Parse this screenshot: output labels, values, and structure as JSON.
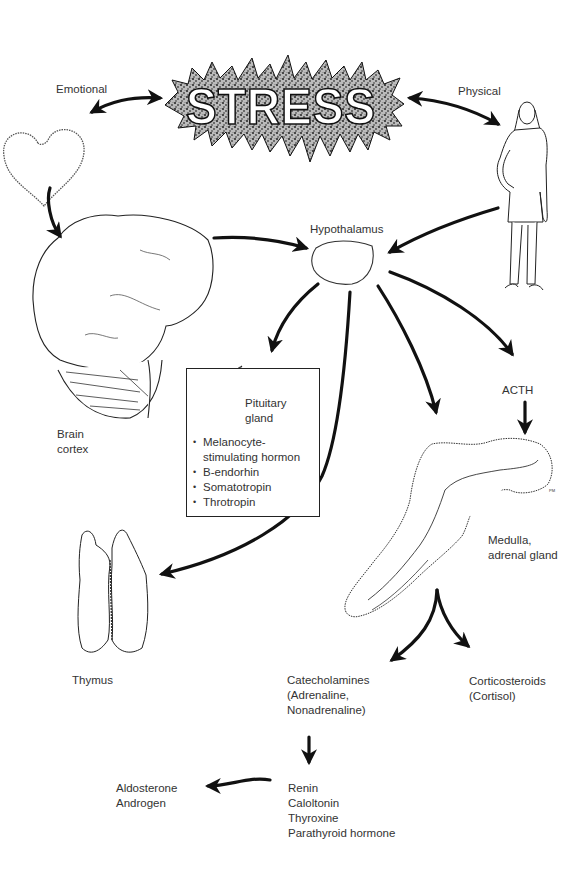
{
  "diagram": {
    "title": "STRESS",
    "colors": {
      "ink": "#111111",
      "text": "#333333",
      "background": "#ffffff"
    },
    "inputs": [
      {
        "id": "emotional",
        "label": "Emotional",
        "icon": "heart-icon"
      },
      {
        "id": "physical",
        "label": "Physical",
        "icon": "woman-figure-icon"
      }
    ],
    "nodes": {
      "brain": {
        "label_lines": [
          "Brain",
          "cortex"
        ],
        "icon": "brain-icon"
      },
      "hypothalamus": {
        "label": "Hypothalamus",
        "icon": "hypothalamus-icon"
      },
      "pituitary": {
        "title_lines": [
          "Pituitary",
          "gland"
        ],
        "icon": "pituitary-icon",
        "hormones": [
          "Melanocyte-",
          "stimulating hormon",
          "B-endorhin",
          "Somatotropin",
          "Throtropin"
        ]
      },
      "acth": {
        "label": "ACTH"
      },
      "adrenal": {
        "label_lines": [
          "Medulla,",
          "adrenal gland"
        ],
        "icon": "adrenal-gland-icon",
        "signature": "PM"
      },
      "thymus": {
        "label": "Thymus",
        "icon": "thymus-icon"
      },
      "catecholamines": {
        "label_lines": [
          "Catecholamines",
          "(Adrenaline,",
          "Nonadrenaline)"
        ]
      },
      "corticosteroids": {
        "label_lines": [
          "Corticosteroids",
          "(Cortisol)"
        ]
      },
      "renin_group": {
        "label_lines": [
          "Renin",
          "Caloltonin",
          "Thyroxine",
          "Parathyroid hormone"
        ]
      },
      "aldosterone_group": {
        "label_lines": [
          "Aldosterone",
          "Androgen"
        ]
      }
    },
    "edges": [
      {
        "from": "stress",
        "to": "emotional",
        "type": "bidirectional"
      },
      {
        "from": "stress",
        "to": "physical",
        "type": "bidirectional"
      },
      {
        "from": "emotional",
        "to": "brain"
      },
      {
        "from": "brain",
        "to": "hypothalamus"
      },
      {
        "from": "physical",
        "to": "hypothalamus"
      },
      {
        "from": "hypothalamus",
        "to": "pituitary"
      },
      {
        "from": "hypothalamus",
        "to": "thymus"
      },
      {
        "from": "hypothalamus",
        "to": "adrenal"
      },
      {
        "from": "hypothalamus",
        "to": "acth"
      },
      {
        "from": "acth",
        "to": "adrenal"
      },
      {
        "from": "adrenal",
        "to": "catecholamines"
      },
      {
        "from": "adrenal",
        "to": "corticosteroids"
      },
      {
        "from": "catecholamines",
        "to": "renin_group"
      },
      {
        "from": "renin_group",
        "to": "aldosterone_group"
      }
    ]
  }
}
